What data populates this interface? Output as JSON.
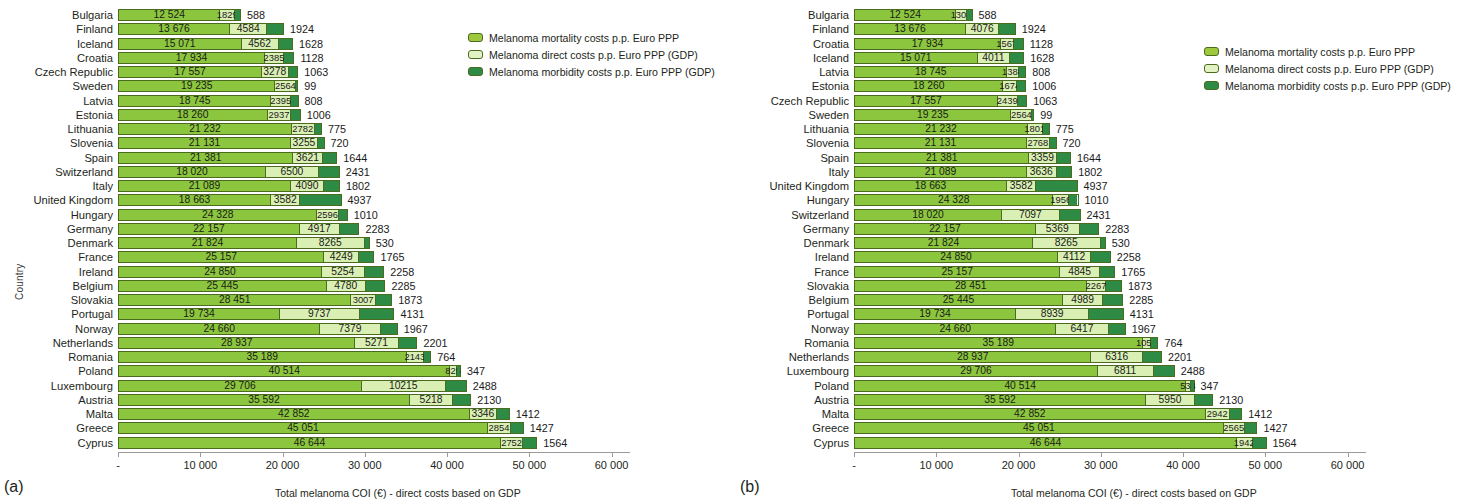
{
  "figure": {
    "y_axis_title": "Country",
    "x_axis_title": "Total melanoma COI (€) - direct costs based on GDP",
    "x_ticks": [
      "-",
      "10 000",
      "20 000",
      "30 000",
      "40 000",
      "50 000",
      "60 000"
    ],
    "x_tick_values": [
      0,
      10000,
      20000,
      30000,
      40000,
      50000,
      60000
    ],
    "legend": [
      {
        "key": "mortality",
        "label": "Melanoma mortality costs p.p. Euro PPP",
        "color": "#9ec93f"
      },
      {
        "key": "direct",
        "label": "Melanoma direct costs p.p. Euro PPP (GDP)",
        "color": "#e3f2c4"
      },
      {
        "key": "morbidity",
        "label": "Melanoma morbidity costs p.p. Euro PPP (GDP)",
        "color": "#2e8b45"
      }
    ],
    "panels": [
      {
        "caption": "(a)"
      },
      {
        "caption": "(b)"
      }
    ]
  },
  "chart_data": [
    {
      "type": "bar",
      "orientation": "horizontal",
      "stacked": true,
      "panel": "(a)",
      "title": "",
      "xlabel": "Total melanoma COI (€) - direct costs based on GDP",
      "ylabel": "Country",
      "xlim": [
        0,
        62000
      ],
      "grid": false,
      "legend_position": "top-right",
      "series": [
        {
          "name": "Melanoma mortality costs p.p. Euro PPP",
          "key": "mortality",
          "color": "#9ec93f"
        },
        {
          "name": "Melanoma direct costs p.p. Euro PPP (GDP)",
          "key": "direct",
          "color": "#e3f2c4"
        },
        {
          "name": "Melanoma morbidity costs p.p. Euro PPP (GDP)",
          "key": "morbidity",
          "color": "#2e8b45"
        }
      ],
      "categories": [
        "Bulgaria",
        "Finland",
        "Iceland",
        "Croatia",
        "Czech Republic",
        "Sweden",
        "Latvia",
        "Estonia",
        "Lithuania",
        "Slovenia",
        "Spain",
        "Switzerland",
        "Italy",
        "United Kingdom",
        "Hungary",
        "Germany",
        "Denmark",
        "France",
        "Ireland",
        "Belgium",
        "Slovakia",
        "Portugal",
        "Norway",
        "Netherlands",
        "Romania",
        "Poland",
        "Luxembourg",
        "Austria",
        "Malta",
        "Greece",
        "Cyprus"
      ],
      "rows": [
        {
          "category": "Bulgaria",
          "mortality": 12524,
          "direct": 1829,
          "morbidity": 588
        },
        {
          "category": "Finland",
          "mortality": 13676,
          "direct": 4584,
          "morbidity": 1924
        },
        {
          "category": "Iceland",
          "mortality": 15071,
          "direct": 4562,
          "morbidity": 1628
        },
        {
          "category": "Croatia",
          "mortality": 17934,
          "direct": 2385,
          "morbidity": 1128
        },
        {
          "category": "Czech Republic",
          "mortality": 17557,
          "direct": 3278,
          "morbidity": 1063
        },
        {
          "category": "Sweden",
          "mortality": 19235,
          "direct": 2564,
          "morbidity": 99
        },
        {
          "category": "Latvia",
          "mortality": 18745,
          "direct": 2395,
          "morbidity": 808
        },
        {
          "category": "Estonia",
          "mortality": 18260,
          "direct": 2937,
          "morbidity": 1006
        },
        {
          "category": "Lithuania",
          "mortality": 21232,
          "direct": 2782,
          "morbidity": 775
        },
        {
          "category": "Slovenia",
          "mortality": 21131,
          "direct": 3255,
          "morbidity": 720
        },
        {
          "category": "Spain",
          "mortality": 21381,
          "direct": 3621,
          "morbidity": 1644
        },
        {
          "category": "Switzerland",
          "mortality": 18020,
          "direct": 6500,
          "morbidity": 2431
        },
        {
          "category": "Italy",
          "mortality": 21089,
          "direct": 4090,
          "morbidity": 1802
        },
        {
          "category": "United Kingdom",
          "mortality": 18663,
          "direct": 3582,
          "morbidity": 4937
        },
        {
          "category": "Hungary",
          "mortality": 24328,
          "direct": 2596,
          "morbidity": 1010
        },
        {
          "category": "Germany",
          "mortality": 22157,
          "direct": 4917,
          "morbidity": 2283
        },
        {
          "category": "Denmark",
          "mortality": 21824,
          "direct": 8265,
          "morbidity": 530
        },
        {
          "category": "France",
          "mortality": 25157,
          "direct": 4249,
          "morbidity": 1765
        },
        {
          "category": "Ireland",
          "mortality": 24850,
          "direct": 5254,
          "morbidity": 2258
        },
        {
          "category": "Belgium",
          "mortality": 25445,
          "direct": 4780,
          "morbidity": 2285
        },
        {
          "category": "Slovakia",
          "mortality": 28451,
          "direct": 3007,
          "morbidity": 1873
        },
        {
          "category": "Portugal",
          "mortality": 19734,
          "direct": 9737,
          "morbidity": 4131
        },
        {
          "category": "Norway",
          "mortality": 24660,
          "direct": 7379,
          "morbidity": 1967
        },
        {
          "category": "Netherlands",
          "mortality": 28937,
          "direct": 5271,
          "morbidity": 2201
        },
        {
          "category": "Romania",
          "mortality": 35189,
          "direct": 2143,
          "morbidity": 764
        },
        {
          "category": "Poland",
          "mortality": 40514,
          "direct": 825,
          "morbidity": 347
        },
        {
          "category": "Luxembourg",
          "mortality": 29706,
          "direct": 10215,
          "morbidity": 2488
        },
        {
          "category": "Austria",
          "mortality": 35592,
          "direct": 5218,
          "morbidity": 2130
        },
        {
          "category": "Malta",
          "mortality": 42852,
          "direct": 3346,
          "morbidity": 1412
        },
        {
          "category": "Greece",
          "mortality": 45051,
          "direct": 2854,
          "morbidity": 1427
        },
        {
          "category": "Cyprus",
          "mortality": 46644,
          "direct": 2752,
          "morbidity": 1564
        }
      ],
      "labels": {
        "mortality": [
          "12 524",
          "13 676",
          "15 071",
          "17 934",
          "17 557",
          "19 235",
          "18 745",
          "18 260",
          "21 232",
          "21 131",
          "21 381",
          "18 020",
          "21 089",
          "18 663",
          "24 328",
          "22 157",
          "21 824",
          "25 157",
          "24 850",
          "25 445",
          "28 451",
          "19 734",
          "24 660",
          "28 937",
          "35 189",
          "40 514",
          "29 706",
          "35 592",
          "42 852",
          "45 051",
          "46 644"
        ],
        "direct": [
          "1829",
          "4584",
          "4562",
          "2385",
          "3278",
          "2564",
          "2395",
          "2937",
          "2782",
          "3255",
          "3621",
          "6500",
          "4090",
          "3582",
          "2596",
          "4917",
          "8265",
          "4249",
          "5254",
          "4780",
          "3007",
          "9737",
          "7379",
          "5271",
          "2143",
          "825",
          "10215",
          "5218",
          "3346",
          "2854",
          "2752"
        ],
        "morbidity": [
          "588",
          "1924",
          "1628",
          "1128",
          "1063",
          "99",
          "808",
          "1006",
          "775",
          "720",
          "1644",
          "2431",
          "1802",
          "4937",
          "1010",
          "2283",
          "530",
          "1765",
          "2258",
          "2285",
          "1873",
          "4131",
          "1967",
          "2201",
          "764",
          "347",
          "2488",
          "2130",
          "1412",
          "1427",
          "1564"
        ]
      }
    },
    {
      "type": "bar",
      "orientation": "horizontal",
      "stacked": true,
      "panel": "(b)",
      "title": "",
      "xlabel": "Total melanoma COI (€) - direct costs based on GDP",
      "ylabel": "Country",
      "xlim": [
        0,
        62000
      ],
      "grid": false,
      "legend_position": "top-right",
      "series": [
        {
          "name": "Melanoma mortality costs p.p. Euro PPP",
          "key": "mortality",
          "color": "#9ec93f"
        },
        {
          "name": "Melanoma direct costs p.p. Euro PPP (GDP)",
          "key": "direct",
          "color": "#e3f2c4"
        },
        {
          "name": "Melanoma morbidity costs p.p. Euro PPP (GDP)",
          "key": "morbidity",
          "color": "#2e8b45"
        }
      ],
      "categories": [
        "Bulgaria",
        "Finland",
        "Croatia",
        "Iceland",
        "Latvia",
        "Estonia",
        "Czech Republic",
        "Sweden",
        "Lithuania",
        "Slovenia",
        "Spain",
        "Italy",
        "United Kingdom",
        "Hungary",
        "Switzerland",
        "Germany",
        "Denmark",
        "Ireland",
        "France",
        "Slovakia",
        "Belgium",
        "Portugal",
        "Norway",
        "Romania",
        "Netherlands",
        "Luxembourg",
        "Poland",
        "Austria",
        "Malta",
        "Greece",
        "Cyprus"
      ],
      "rows": [
        {
          "category": "Bulgaria",
          "mortality": 12524,
          "direct": 1308,
          "morbidity": 588
        },
        {
          "category": "Finland",
          "mortality": 13676,
          "direct": 4076,
          "morbidity": 1924
        },
        {
          "category": "Croatia",
          "mortality": 17934,
          "direct": 1567,
          "morbidity": 1128
        },
        {
          "category": "Iceland",
          "mortality": 15071,
          "direct": 4011,
          "morbidity": 1628
        },
        {
          "category": "Latvia",
          "mortality": 18745,
          "direct": 1388,
          "morbidity": 808
        },
        {
          "category": "Estonia",
          "mortality": 18260,
          "direct": 1674,
          "morbidity": 1006
        },
        {
          "category": "Czech Republic",
          "mortality": 17557,
          "direct": 2439,
          "morbidity": 1063
        },
        {
          "category": "Sweden",
          "mortality": 19235,
          "direct": 2564,
          "morbidity": 99
        },
        {
          "category": "Lithuania",
          "mortality": 21232,
          "direct": 1801,
          "morbidity": 775
        },
        {
          "category": "Slovenia",
          "mortality": 21131,
          "direct": 2768,
          "morbidity": 720
        },
        {
          "category": "Spain",
          "mortality": 21381,
          "direct": 3359,
          "morbidity": 1644
        },
        {
          "category": "Italy",
          "mortality": 21089,
          "direct": 3636,
          "morbidity": 1802
        },
        {
          "category": "United Kingdom",
          "mortality": 18663,
          "direct": 3582,
          "morbidity": 4937
        },
        {
          "category": "Hungary",
          "mortality": 24328,
          "direct": 1956,
          "morbidity": 1010
        },
        {
          "category": "Switzerland",
          "mortality": 18020,
          "direct": 7097,
          "morbidity": 2431
        },
        {
          "category": "Germany",
          "mortality": 22157,
          "direct": 5369,
          "morbidity": 2283
        },
        {
          "category": "Denmark",
          "mortality": 21824,
          "direct": 8265,
          "morbidity": 530
        },
        {
          "category": "Ireland",
          "mortality": 24850,
          "direct": 4112,
          "morbidity": 2258
        },
        {
          "category": "France",
          "mortality": 25157,
          "direct": 4845,
          "morbidity": 1765
        },
        {
          "category": "Slovakia",
          "mortality": 28451,
          "direct": 2267,
          "morbidity": 1873
        },
        {
          "category": "Belgium",
          "mortality": 25445,
          "direct": 4989,
          "morbidity": 2285
        },
        {
          "category": "Portugal",
          "mortality": 19734,
          "direct": 8939,
          "morbidity": 4131
        },
        {
          "category": "Norway",
          "mortality": 24660,
          "direct": 6417,
          "morbidity": 1967
        },
        {
          "category": "Romania",
          "mortality": 35189,
          "direct": 1056,
          "morbidity": 764
        },
        {
          "category": "Netherlands",
          "mortality": 28937,
          "direct": 6316,
          "morbidity": 2201
        },
        {
          "category": "Luxembourg",
          "mortality": 29706,
          "direct": 6811,
          "morbidity": 2488
        },
        {
          "category": "Poland",
          "mortality": 40514,
          "direct": 534,
          "morbidity": 347
        },
        {
          "category": "Austria",
          "mortality": 35592,
          "direct": 5950,
          "morbidity": 2130
        },
        {
          "category": "Malta",
          "mortality": 42852,
          "direct": 2942,
          "morbidity": 1412
        },
        {
          "category": "Greece",
          "mortality": 45051,
          "direct": 2565,
          "morbidity": 1427
        },
        {
          "category": "Cyprus",
          "mortality": 46644,
          "direct": 1942,
          "morbidity": 1564
        }
      ],
      "labels": {
        "mortality": [
          "12 524",
          "13 676",
          "17 934",
          "15 071",
          "18 745",
          "18 260",
          "17 557",
          "19 235",
          "21 232",
          "21 131",
          "21 381",
          "21 089",
          "18 663",
          "24 328",
          "18 020",
          "22 157",
          "21 824",
          "24 850",
          "25 157",
          "28 451",
          "25 445",
          "19 734",
          "24 660",
          "35 189",
          "28 937",
          "29 706",
          "40 514",
          "35 592",
          "42 852",
          "45 051",
          "46 644"
        ],
        "direct": [
          "1308",
          "4076",
          "1567",
          "4011",
          "1388",
          "1674",
          "2439",
          "2564",
          "1801",
          "2768",
          "3359",
          "3636",
          "3582",
          "1956",
          "7097",
          "5369",
          "8265",
          "4112",
          "4845",
          "2267",
          "4989",
          "8939",
          "6417",
          "1056",
          "6316",
          "6811",
          "534",
          "5950",
          "2942",
          "2565",
          "1942"
        ],
        "morbidity": [
          "588",
          "1924",
          "1128",
          "1628",
          "808",
          "1006",
          "1063",
          "99",
          "775",
          "720",
          "1644",
          "1802",
          "4937",
          "1010",
          "2431",
          "2283",
          "530",
          "2258",
          "1765",
          "1873",
          "2285",
          "4131",
          "1967",
          "764",
          "2201",
          "2488",
          "347",
          "2130",
          "1412",
          "1427",
          "1564"
        ]
      }
    }
  ]
}
